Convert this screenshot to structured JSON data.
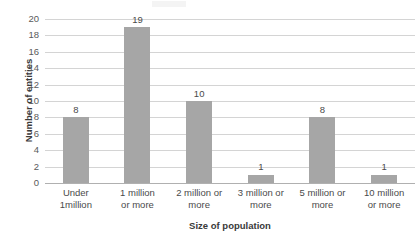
{
  "chart_data": {
    "type": "bar",
    "title": "",
    "xlabel": "Size of population",
    "ylabel": "Number of entities",
    "categories": [
      "Under 1million",
      "1 million or more",
      "2 million or more",
      "3 million or more",
      "5 million or more",
      "10 million or more"
    ],
    "category_lines": [
      [
        "Under",
        "1million"
      ],
      [
        "1 million",
        "or more"
      ],
      [
        "2 million or",
        "more"
      ],
      [
        "3 million or",
        "more"
      ],
      [
        "5 million or",
        "more"
      ],
      [
        "10 million",
        "or more"
      ]
    ],
    "values": [
      8,
      19,
      10,
      1,
      8,
      1
    ],
    "data_labels": [
      "8",
      "19",
      "10",
      "1",
      "8",
      "1"
    ],
    "ylim": [
      0,
      20
    ],
    "ytick_step": 2,
    "yticks": [
      "20",
      "18",
      "16",
      "14",
      "12",
      "10",
      "8",
      "6",
      "4",
      "2",
      "0"
    ],
    "ytick_values": [
      20,
      18,
      16,
      14,
      12,
      10,
      8,
      6,
      4,
      2,
      0
    ],
    "grid": true,
    "grid_axis": "y",
    "legend": false,
    "legend_position": "none",
    "colors": {
      "bar_fill": "#a6a6a6",
      "gridline": "#d4d4d4",
      "axis_line": "#b0b0b0",
      "tick_text": "#5a5a5a",
      "title_text": "#3a3a3a",
      "background": "#ffffff"
    }
  }
}
